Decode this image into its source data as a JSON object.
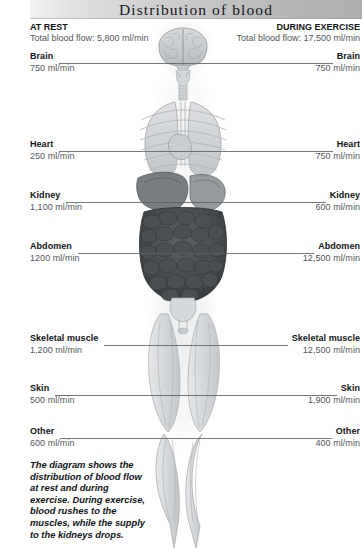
{
  "title": "Distribution of blood",
  "columns": {
    "rest": {
      "heading": "AT REST",
      "total": "Total blood flow: 5,800 ml/min"
    },
    "exercise": {
      "heading": "DURING EXERCISE",
      "total": "Total blood flow: 17,500 ml/min"
    }
  },
  "rows": [
    {
      "label": "Brain",
      "rest": "750 ml/min",
      "exercise": "750 ml/min",
      "y": 63
    },
    {
      "label": "Heart",
      "rest": "250 ml/min",
      "exercise": "750 ml/min",
      "y": 151
    },
    {
      "label": "Kidney",
      "rest": "1,100 ml/min",
      "exercise": "600 ml/min",
      "y": 202
    },
    {
      "label": "Abdomen",
      "rest": "1200 ml/min",
      "exercise": "12,500 ml/min",
      "y": 253
    },
    {
      "label": "Skeletal muscle",
      "rest": "1,200 ml/min",
      "exercise": "12,500 ml/min",
      "y": 345
    },
    {
      "label": "Skin",
      "rest": "500 ml/min",
      "exercise": "1,900 ml/min",
      "y": 395
    },
    {
      "label": "Other",
      "rest": "600 ml/min",
      "exercise": "400 ml/min",
      "y": 438
    }
  ],
  "caption": "The diagram shows the distribution of blood flow at rest and during exercise. During exercise, blood rushes to the muscles, while the supply to the kidneys drops.",
  "figure": {
    "organs": [
      "brain-illustration",
      "neck-trachea-illustration",
      "lungs-ribcage-illustration",
      "liver-stomach-illustration",
      "intestines-illustration",
      "bladder-illustration",
      "thigh-muscles-illustration",
      "calf-muscles-illustration"
    ]
  },
  "colors": {
    "label_text": "#111417",
    "value_text": "#53575b",
    "leader_line": "#5d6063",
    "title_bar_light": "#f2f2f2",
    "title_bar_dark": "#aeaeae"
  }
}
